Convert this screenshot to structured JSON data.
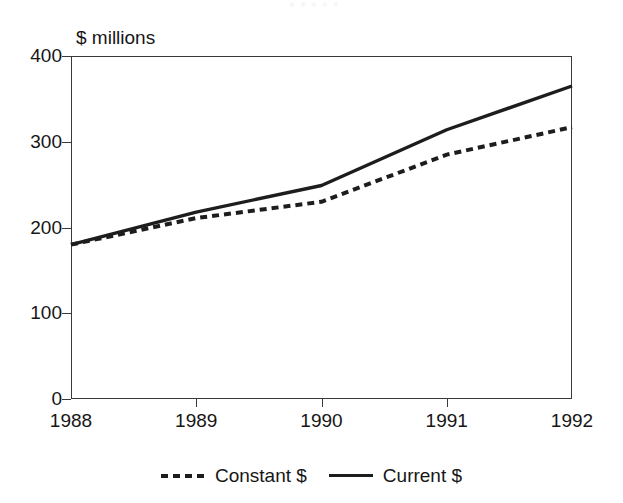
{
  "title_remnant": "• • • • •",
  "axis_unit_label": "$ millions",
  "legend": {
    "items": [
      {
        "label": "Constant $",
        "style": "dashed",
        "swatch_name": "legend-swatch-dashed"
      },
      {
        "label": "Current $",
        "style": "solid",
        "swatch_name": "legend-swatch-solid"
      }
    ]
  },
  "colors": {
    "line": "#1d1d1d",
    "axis": "#3a3a3a",
    "text": "#161616",
    "background": "#ffffff"
  },
  "chart_data": {
    "type": "line",
    "title": "",
    "xlabel": "",
    "ylabel": "$ millions",
    "categories": [
      "1988",
      "1989",
      "1990",
      "1991",
      "1992"
    ],
    "x": [
      1988,
      1989,
      1990,
      1991,
      1992
    ],
    "xlim": [
      1988,
      1992
    ],
    "ylim": [
      0,
      400
    ],
    "yticks": [
      0,
      100,
      200,
      300,
      400
    ],
    "ytick_labels": [
      "0",
      "100",
      "200",
      "300",
      "400"
    ],
    "xticks": [
      1988,
      1989,
      1990,
      1991,
      1992
    ],
    "xtick_labels": [
      "1988",
      "1989",
      "1990",
      "1991",
      "1992"
    ],
    "grid": false,
    "legend_position": "bottom-center",
    "series": [
      {
        "name": "Constant $",
        "style": "dashed",
        "values": [
          180,
          211,
          230,
          285,
          317
        ]
      },
      {
        "name": "Current $",
        "style": "solid",
        "values": [
          180,
          218,
          249,
          314,
          365
        ]
      }
    ]
  }
}
